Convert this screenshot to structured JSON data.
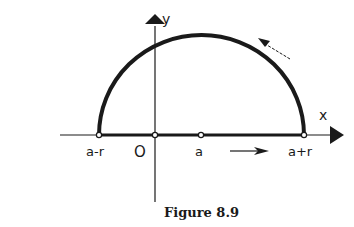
{
  "figure": {
    "caption": "Figure 8.9",
    "axes": {
      "x_label": "x",
      "y_label": "y"
    },
    "points": {
      "left": "a-r",
      "origin": "O",
      "center": "a",
      "right": "a+r"
    },
    "colors": {
      "ink": "#1a1a1a",
      "background": "#ffffff"
    }
  }
}
